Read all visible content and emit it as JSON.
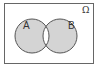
{
  "diagram": {
    "type": "venn",
    "universe_label": "Ω",
    "sets": [
      {
        "label": "A"
      },
      {
        "label": "B"
      }
    ],
    "shaded_region": "symmetric difference (A only and B only)",
    "colors": {
      "shade": "#d4d4d4",
      "stroke": "#555555",
      "background": "#ffffff"
    }
  }
}
